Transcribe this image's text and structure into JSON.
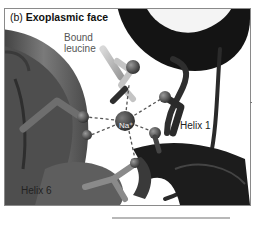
{
  "figure": {
    "panel_letter": "(b)",
    "title": "Exoplasmic face",
    "labels": {
      "bound_leucine_line1": "Bound",
      "bound_leucine_line2": "leucine",
      "helix1": "Helix 1",
      "helix6": "Helix 6",
      "ion": "Na⁺"
    },
    "colors": {
      "helix1_ribbon": "#1a1a1a",
      "helix6_ribbon": "#5a5a5a",
      "leucine_stick": "#b8b8b8",
      "ion_sphere": "#4a4a4a",
      "border": "#8a8a8a",
      "coordination_bonds": "#555555"
    }
  }
}
